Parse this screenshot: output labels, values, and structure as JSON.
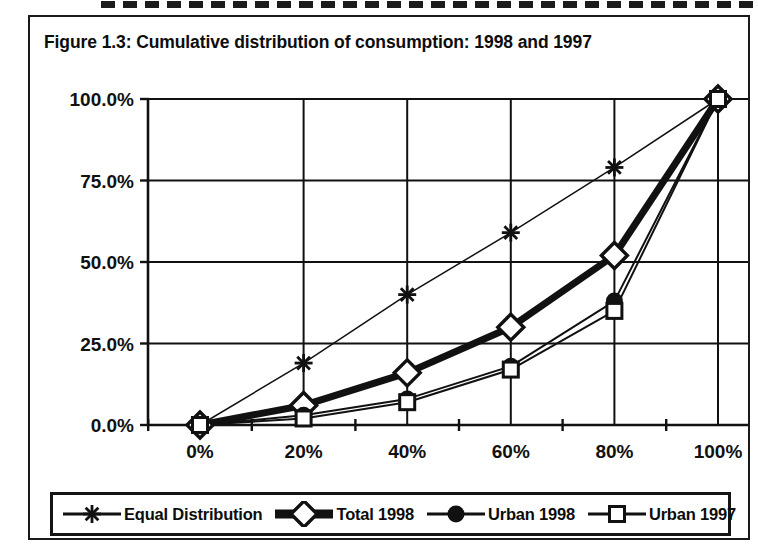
{
  "figure": {
    "title": "Figure 1.3:  Cumulative distribution of consumption: 1998 and 1997"
  },
  "chart_data": {
    "type": "line",
    "title": "Figure 1.3:  Cumulative distribution of consumption: 1998 and 1997",
    "xlabel": "",
    "ylabel": "",
    "categories": [
      "0%",
      "20%",
      "40%",
      "60%",
      "80%",
      "100%"
    ],
    "x": [
      0,
      20,
      40,
      60,
      80,
      100
    ],
    "xlim": [
      0,
      100
    ],
    "ylim": [
      0,
      100
    ],
    "ytick_labels": [
      "0.0%",
      "25.0%",
      "50.0%",
      "75.0%",
      "100.0%"
    ],
    "ytick_values": [
      0,
      25,
      50,
      75,
      100
    ],
    "xtick_labels": [
      "0%",
      "20%",
      "40%",
      "60%",
      "80%",
      "100%"
    ],
    "grid": "both",
    "legend_position": "bottom",
    "series": [
      {
        "name": "Equal Distribution",
        "marker": "asterisk-star",
        "line_width": 1.5,
        "values": [
          0.0,
          19.0,
          40.0,
          59.0,
          79.0,
          100.0
        ]
      },
      {
        "name": "Total 1998",
        "marker": "open-diamond",
        "line_width": 7,
        "values": [
          0.0,
          6.0,
          16.0,
          30.0,
          52.0,
          100.0
        ]
      },
      {
        "name": "Urban 1998",
        "marker": "filled-circle",
        "line_width": 2,
        "values": [
          0.0,
          3.0,
          8.0,
          18.0,
          38.0,
          100.0
        ]
      },
      {
        "name": "Urban 1997",
        "marker": "open-square",
        "line_width": 2,
        "values": [
          0.0,
          2.0,
          7.0,
          17.0,
          35.0,
          100.0
        ]
      }
    ]
  },
  "legend": {
    "items": [
      {
        "label": "Equal Distribution",
        "marker": "asterisk-star-icon"
      },
      {
        "label": "Total 1998",
        "marker": "open-diamond-icon"
      },
      {
        "label": "Urban 1998",
        "marker": "filled-circle-icon"
      },
      {
        "label": "Urban 1997",
        "marker": "open-square-icon"
      }
    ]
  },
  "colors": {
    "ink": "#111111",
    "paper": "#ffffff"
  }
}
